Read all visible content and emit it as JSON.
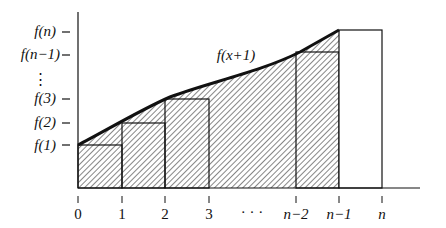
{
  "diagram": {
    "curve_label": "f(x+1)",
    "y_labels": [
      {
        "text": "f(n)",
        "y": 36
      },
      {
        "text": "f(n−1)",
        "y": 59
      },
      {
        "text": "f(3)",
        "y": 103
      },
      {
        "text": "f(2)",
        "y": 127
      },
      {
        "text": "f(1)",
        "y": 150
      }
    ],
    "y_ellipsis": "⋮",
    "x_labels": [
      {
        "text": "0",
        "x": 78
      },
      {
        "text": "1",
        "x": 122
      },
      {
        "text": "2",
        "x": 165
      },
      {
        "text": "3",
        "x": 209
      },
      {
        "text": "· · ·",
        "x": 252
      },
      {
        "text": "n−2",
        "x": 296
      },
      {
        "text": "n−1",
        "x": 339
      },
      {
        "text": "n",
        "x": 382
      }
    ],
    "colors": {
      "line": "#111111",
      "hatch": "#222222",
      "background": "#ffffff"
    }
  }
}
